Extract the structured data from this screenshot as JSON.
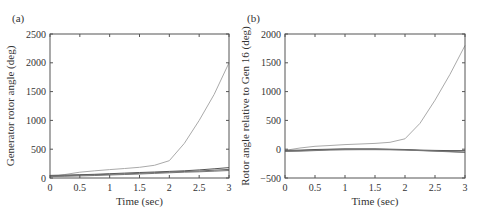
{
  "chart_data": [
    {
      "type": "line",
      "panel_label": "(a)",
      "title": "",
      "xlabel": "Time (sec)",
      "ylabel": "Generator rotor angle (deg)",
      "xlim": [
        0,
        3
      ],
      "ylim": [
        0,
        2500
      ],
      "xticks": [
        "0",
        "0.5",
        "1",
        "1.5",
        "2",
        "2.5",
        "3"
      ],
      "yticks": [
        "0",
        "500",
        "1000",
        "1500",
        "2000",
        "2500"
      ],
      "grid": false,
      "legend": null,
      "x": [
        0,
        0.25,
        0.5,
        0.75,
        1.0,
        1.25,
        1.5,
        1.75,
        2.0,
        2.25,
        2.5,
        2.75,
        3.0
      ],
      "series": [
        {
          "name": "Unstable generator",
          "color": "#aaaaaa",
          "values": [
            20,
            60,
            100,
            125,
            145,
            165,
            185,
            220,
            300,
            600,
            1000,
            1450,
            2000
          ]
        },
        {
          "name": "Group upper",
          "color": "#555555",
          "values": [
            45,
            50,
            58,
            65,
            75,
            85,
            95,
            105,
            115,
            125,
            140,
            160,
            180
          ]
        },
        {
          "name": "Group middle",
          "color": "#666666",
          "values": [
            35,
            40,
            48,
            56,
            64,
            72,
            82,
            92,
            102,
            112,
            122,
            135,
            150
          ]
        },
        {
          "name": "Group lower",
          "color": "#777777",
          "values": [
            25,
            30,
            36,
            44,
            52,
            60,
            70,
            80,
            90,
            100,
            108,
            118,
            130
          ]
        }
      ]
    },
    {
      "type": "line",
      "panel_label": "(b)",
      "title": "",
      "xlabel": "Time (sec)",
      "ylabel": "Rotor angle relative to Gen 16 (deg)",
      "xlim": [
        0,
        3
      ],
      "ylim": [
        -500,
        2000
      ],
      "xticks": [
        "0",
        "0.5",
        "1",
        "1.5",
        "2",
        "2.5",
        "3"
      ],
      "yticks": [
        "-500",
        "0",
        "500",
        "1000",
        "1500",
        "2000"
      ],
      "grid": false,
      "legend": null,
      "x": [
        0,
        0.25,
        0.5,
        0.75,
        1.0,
        1.25,
        1.5,
        1.75,
        2.0,
        2.25,
        2.5,
        2.75,
        3.0
      ],
      "series": [
        {
          "name": "Unstable generator",
          "color": "#aaaaaa",
          "values": [
            -20,
            20,
            50,
            65,
            80,
            90,
            100,
            120,
            180,
            450,
            850,
            1300,
            1800
          ]
        },
        {
          "name": "Group upper",
          "color": "#555555",
          "values": [
            -20,
            -15,
            -5,
            0,
            5,
            5,
            5,
            0,
            -5,
            -15,
            -20,
            -25,
            -25
          ]
        },
        {
          "name": "Group middle",
          "color": "#666666",
          "values": [
            -30,
            -25,
            -15,
            -5,
            0,
            0,
            0,
            -5,
            -10,
            -20,
            -30,
            -40,
            -50
          ]
        },
        {
          "name": "Group lower",
          "color": "#777777",
          "values": [
            -40,
            -35,
            -25,
            -15,
            -10,
            -8,
            -8,
            -10,
            -15,
            -25,
            -35,
            -45,
            -55
          ]
        }
      ]
    }
  ]
}
